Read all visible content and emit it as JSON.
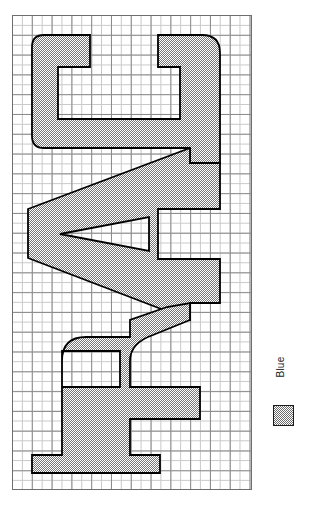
{
  "figure": {
    "title": "",
    "orientation": "rotated-90-ccw",
    "background_color": "#ffffff"
  },
  "plot": {
    "grid": {
      "visible": true,
      "minor_cell_px": 9.9,
      "major_cell_px": 19.8,
      "columns": 24,
      "rows": 48,
      "minor_color": "#c9c9c9",
      "major_color": "#8b8b8b",
      "border_color": "#6e6e6e"
    },
    "shape": {
      "label": "RAU",
      "description": "Block letters R, A, U drawn rotated 90 degrees counter-clockwise on grid paper",
      "fill_color": "#a8a8a8",
      "fill_pattern": "checkerboard-dither",
      "outline_color": "#000000",
      "outline_width_px": 1.6,
      "letters": [
        "R",
        "A",
        "U"
      ]
    }
  },
  "legend": {
    "position": "right",
    "entries": [
      {
        "label": "Blue",
        "swatch_fill": "#a8a8a8",
        "swatch_pattern": "checkerboard-dither",
        "swatch_border": "#1a1a1a"
      }
    ]
  }
}
